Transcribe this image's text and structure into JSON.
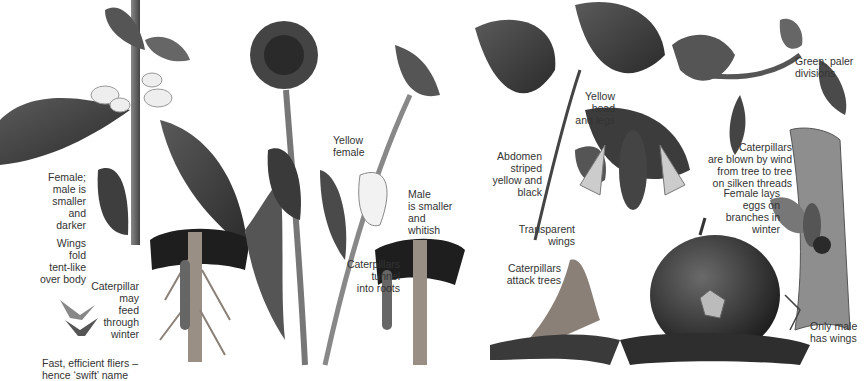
{
  "plate": {
    "panels": [
      {
        "id": "ghost-swift",
        "labels": {
          "female": "Female;\nmale is\nsmaller\nand\ndarker",
          "wings": "Wings\nfold\ntent-like\nover body",
          "caterpillar": "Caterpillar\nmay\nfeed\nthrough\nwinter",
          "fliers": "Fast, efficient fliers –\nhence ‘swift’ name"
        }
      },
      {
        "id": "dandelion-moth",
        "labels": {
          "female": "Yellow\nfemale",
          "male": "Male\nis smaller\nand\nwhitish",
          "caterpillars": "Caterpillars\ntunnel\ninto roots"
        }
      },
      {
        "id": "hornet-moth",
        "labels": {
          "head": "Yellow\nhead\nand legs",
          "abdomen": "Abdomen\nstriped\nyellow and\nblack",
          "wings": "Transparent\nwings",
          "caterpillars": "Caterpillars\nattack trees"
        }
      },
      {
        "id": "winter-moth",
        "labels": {
          "colour": "Green; paler\ndivisions",
          "caterpillars": "Caterpillars\nare blown by wind\nfrom tree to tree\non silken threads",
          "female": "Female lays\neggs on\nbranches in\nwinter",
          "male": "Only male\nhas wings"
        }
      }
    ],
    "colors": {
      "text": "#333333",
      "ink": "#2a2a2a",
      "leaf": "#4a4a4a",
      "soil": "#1e1e1e",
      "root": "#9a8f85"
    }
  }
}
